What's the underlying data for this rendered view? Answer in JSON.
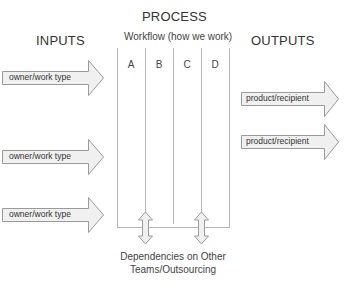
{
  "process": {
    "title": "PROCESS",
    "subtitle": "Workflow (how we work)",
    "columns": [
      "A",
      "B",
      "C",
      "D"
    ]
  },
  "inputs": {
    "title": "INPUTS",
    "items": [
      {
        "label": "owner/work type"
      },
      {
        "label": "owner/work type"
      },
      {
        "label": "owner/work type"
      }
    ]
  },
  "outputs": {
    "title": "OUTPUTS",
    "items": [
      {
        "label": "product/recipient"
      },
      {
        "label": "product/recipient"
      }
    ]
  },
  "dependencies": {
    "line1": "Dependencies on Other",
    "line2": "Teams/Outsourcing"
  },
  "colors": {
    "arrow_fill": "#f0f0f0",
    "arrow_stroke": "#999999",
    "line": "#aaaaaa",
    "text": "#3a3a3a"
  }
}
